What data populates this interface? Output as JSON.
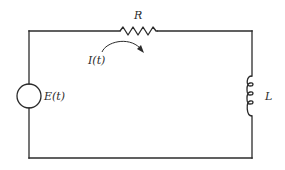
{
  "diagram": {
    "type": "circuit",
    "labels": {
      "resistor": "R",
      "current": "I(t)",
      "source": "E(t)",
      "inductor": "L"
    },
    "components": [
      {
        "id": "source",
        "kind": "voltage-source",
        "label": "E(t)",
        "position": "left"
      },
      {
        "id": "resistor",
        "kind": "resistor",
        "label": "R",
        "position": "top"
      },
      {
        "id": "inductor",
        "kind": "inductor",
        "label": "L",
        "position": "right"
      }
    ],
    "current_arrow": {
      "label": "I(t)",
      "direction": "clockwise"
    },
    "colors": {
      "line": "#2b2b2b",
      "background": "#ffffff"
    }
  }
}
